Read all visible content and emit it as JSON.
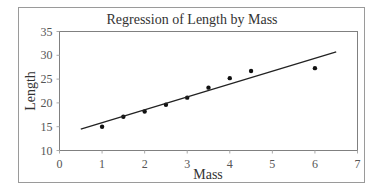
{
  "chart_data": {
    "type": "scatter",
    "title": "Regression of Length by Mass",
    "xlabel": "Mass",
    "ylabel": "Length",
    "xlim": [
      0,
      7
    ],
    "ylim": [
      10,
      35
    ],
    "x_ticks": [
      0,
      1,
      2,
      3,
      4,
      5,
      6,
      7
    ],
    "y_ticks": [
      10,
      15,
      20,
      25,
      30,
      35
    ],
    "grid": false,
    "legend": null,
    "series": [
      {
        "name": "Observed",
        "kind": "scatter",
        "points": [
          {
            "x": 1.0,
            "y": 15.0
          },
          {
            "x": 1.5,
            "y": 17.1
          },
          {
            "x": 2.0,
            "y": 18.2
          },
          {
            "x": 2.5,
            "y": 19.6
          },
          {
            "x": 3.0,
            "y": 21.1
          },
          {
            "x": 3.5,
            "y": 23.2
          },
          {
            "x": 4.0,
            "y": 25.2
          },
          {
            "x": 4.5,
            "y": 26.7
          },
          {
            "x": 6.0,
            "y": 27.3
          }
        ]
      },
      {
        "name": "Regression line",
        "kind": "line",
        "points": [
          {
            "x": 0.5,
            "y": 14.5
          },
          {
            "x": 6.5,
            "y": 30.7
          }
        ]
      }
    ]
  },
  "colors": {
    "points": "#111111",
    "line": "#222222",
    "frame": "#9a9a9a",
    "plot_border": "#808080",
    "text": "#333333"
  }
}
